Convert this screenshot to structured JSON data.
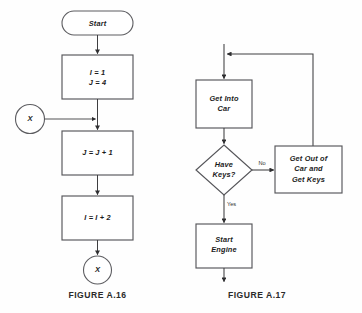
{
  "page": {
    "background_color": "#fefefe",
    "shape_stroke_color": "#56565a",
    "line_color": "#3e3e40",
    "text_color": "#1c1c1c",
    "width": 362,
    "height": 313
  },
  "figures": [
    {
      "id": "figure-a16",
      "caption": "FIGURE A.16",
      "nodes": {
        "start": "Start",
        "init_line1": "I = 1",
        "init_line2": "J = 4",
        "increment_j": "J = J + 1",
        "increment_i": "I = I + 2",
        "connector_in": "X",
        "connector_out": "X"
      }
    },
    {
      "id": "figure-a17",
      "caption": "FIGURE A.17",
      "nodes": {
        "get_into_car_line1": "Get Into",
        "get_into_car_line2": "Car",
        "decision_line1": "Have",
        "decision_line2": "Keys?",
        "get_keys_line1": "Get Out of",
        "get_keys_line2": "Car and",
        "get_keys_line3": "Get Keys",
        "start_engine_line1": "Start",
        "start_engine_line2": "Engine"
      },
      "edges": {
        "no_label": "No",
        "yes_label": "Yes"
      }
    }
  ]
}
